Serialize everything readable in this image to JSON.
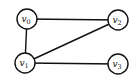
{
  "diagram": {
    "type": "undirected-graph",
    "nodes": [
      {
        "id": "v0",
        "label": "v",
        "sub": "0",
        "x": 27,
        "y": 19
      },
      {
        "id": "v1",
        "label": "v",
        "sub": "1",
        "x": 25,
        "y": 63
      },
      {
        "id": "v2",
        "label": "v",
        "sub": "2",
        "x": 118,
        "y": 20
      },
      {
        "id": "v3",
        "label": "v",
        "sub": "3",
        "x": 118,
        "y": 64
      }
    ],
    "edges": [
      {
        "from": "v0",
        "to": "v2"
      },
      {
        "from": "v0",
        "to": "v1"
      },
      {
        "from": "v1",
        "to": "v2"
      },
      {
        "from": "v1",
        "to": "v3"
      }
    ],
    "node_radius": 10,
    "stroke_color": "#111111",
    "fill_color": "#ffffff"
  }
}
